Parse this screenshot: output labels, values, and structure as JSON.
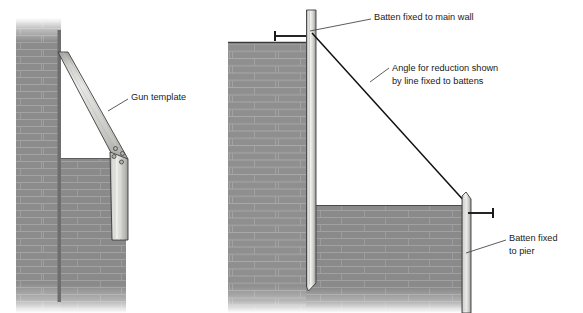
{
  "figure": {
    "title": "",
    "background_color": "#ffffff",
    "width": 583,
    "height": 313
  },
  "palette": {
    "wall_face": "#8c8c8c",
    "wall_face_dark": "#7c7c7c",
    "wall_mortar": "#a3a3a3",
    "wall_mortar_light": "#b0b0b0",
    "timber_light": "#e8e8e6",
    "timber_mid": "#c9c9c6",
    "timber_dark": "#a8a8a5",
    "outline": "#3a3a3a",
    "line_black": "#000000",
    "label_text": "#1a1a1a",
    "leader_line": "#4a4a4a"
  },
  "panels": [
    {
      "id": "left-detail",
      "name": "gun-template-detail",
      "description": "Section through main wall and pier showing gun template fixed at angle"
    },
    {
      "id": "right-detail",
      "name": "battens-and-line-detail",
      "description": "Elevation of main wall and pier with battens and reduction line"
    }
  ],
  "labels": [
    {
      "id": "gun-template",
      "name": "label-gun-template",
      "text": "Gun template",
      "x": 131,
      "y": 100,
      "anchor": "start",
      "lines": [
        "Gun template"
      ]
    },
    {
      "id": "batten-main-wall",
      "name": "label-batten-fixed-to-main-wall",
      "text": "Batten fixed to main wall",
      "x": 374,
      "y": 20,
      "anchor": "start",
      "lines": [
        "Batten fixed to main wall"
      ]
    },
    {
      "id": "angle-for-reduction",
      "name": "label-angle-for-reduction",
      "text": "Angle for reduction shown by line fixed to battens",
      "x": 392,
      "y": 71,
      "anchor": "start",
      "lines": [
        "Angle for reduction shown",
        "by line fixed to battens"
      ]
    },
    {
      "id": "batten-pier",
      "name": "label-batten-fixed-to-pier",
      "text": "Batten fixed to pier",
      "x": 509,
      "y": 241,
      "anchor": "start",
      "lines": [
        "Batten fixed",
        "to pier"
      ]
    }
  ],
  "leaders": [
    {
      "id": "leader-gun-template",
      "name": "leader-line-gun-template",
      "path": "M128,99 L108,111"
    },
    {
      "id": "leader-batten-main",
      "name": "leader-line-batten-main-wall",
      "path": "M371,19 L310,31"
    },
    {
      "id": "leader-angle",
      "name": "leader-line-angle-for-reduction",
      "path": "M389,68 L370,82"
    },
    {
      "id": "leader-batten-pier",
      "name": "leader-line-batten-pier",
      "path": "M506,240 L466,253"
    }
  ],
  "geometry": {
    "left": {
      "main_wall": {
        "x": 16,
        "y": 18,
        "w": 45,
        "h": 295,
        "name": "main-wall-left"
      },
      "pier_wall": {
        "x": 61,
        "y": 158,
        "w": 65,
        "h": 155,
        "name": "pier-wall-left"
      },
      "template_angle_deg": 42,
      "bolt_holes": 4
    },
    "right": {
      "main_wall": {
        "x": 228,
        "y": 42,
        "w": 78,
        "h": 271,
        "name": "main-wall-right"
      },
      "pier_wall": {
        "x": 306,
        "y": 205,
        "w": 160,
        "h": 108,
        "name": "pier-wall-right"
      },
      "batten_main": {
        "x": 306,
        "y": 10,
        "w": 10,
        "h": 278,
        "name": "batten-main-wall"
      },
      "batten_pier": {
        "x": 462,
        "y": 196,
        "w": 9,
        "h": 117,
        "name": "batten-pier"
      },
      "reduction_line": {
        "from": [
          312,
          33
        ],
        "to": [
          466,
          203
        ],
        "name": "reduction-line"
      }
    }
  }
}
